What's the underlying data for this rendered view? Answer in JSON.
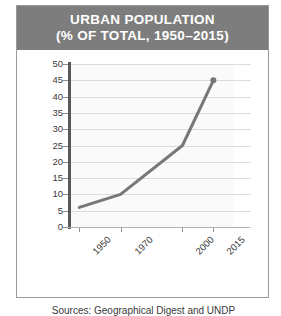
{
  "card": {
    "title_line1": "URBAN POPULATION",
    "title_line2": "(% OF TOTAL, 1950–2015)",
    "source_note": "Sources: Geographical Digest and UNDP",
    "colors": {
      "title_bar_bg": "#7d7d7d",
      "title_text": "#ffffff",
      "card_bg": "#ffffff",
      "card_border": "#9a9a9a",
      "plot_bg": "#fafafa",
      "gridline": "#dcdcdc",
      "axis_spine": "#5a5a5a",
      "line_series": "#777777",
      "tick_text": "#3a3a3a"
    }
  },
  "chart_data": {
    "type": "line",
    "title": "URBAN POPULATION (% OF TOTAL, 1950–2015)",
    "xlabel": "",
    "ylabel": "",
    "x": [
      1950,
      1970,
      2000,
      2015
    ],
    "values": [
      6,
      10,
      25,
      45
    ],
    "series": [
      {
        "name": "Urban population (% of total)",
        "values": [
          6,
          10,
          25,
          45
        ]
      }
    ],
    "xtick_labels": [
      "1950",
      "1970",
      "2000",
      "2015"
    ],
    "ytick_labels": [
      "0",
      "5",
      "10",
      "15",
      "20",
      "25",
      "30",
      "35",
      "40",
      "45",
      "50"
    ],
    "ytick_values": [
      0,
      5,
      10,
      15,
      20,
      25,
      30,
      35,
      40,
      45,
      50
    ],
    "ylim": [
      0,
      50
    ],
    "xlim": [
      1945,
      2025
    ],
    "grid": true,
    "legend": false,
    "marker_last_point": true
  }
}
